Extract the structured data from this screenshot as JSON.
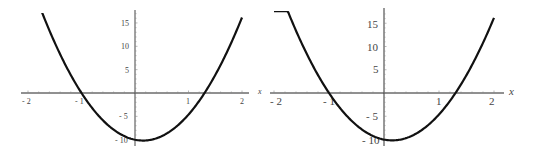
{
  "chart_data": [
    {
      "type": "line",
      "title": "",
      "xlabel": "x",
      "ylabel": "",
      "xlim": [
        -2,
        2
      ],
      "ylim": [
        -10.5,
        17.5
      ],
      "grid": false,
      "x_ticks": [
        "-2",
        "-1",
        "1",
        "2"
      ],
      "y_ticks": [
        "15",
        "10",
        "5",
        "-5",
        "-10"
      ],
      "series": [
        {
          "name": "f(x)",
          "x": [
            -2,
            -1.5,
            -1,
            -0.5,
            0,
            0.2,
            0.5,
            1,
            1.3,
            1.5,
            2
          ],
          "y": [
            25.4,
            9.6,
            0,
            -5.6,
            -10,
            -10.3,
            -9.2,
            -4.6,
            0,
            3.8,
            16.2
          ]
        }
      ]
    },
    {
      "type": "line",
      "title": "",
      "xlabel": "x",
      "ylabel": "",
      "xlim": [
        -2,
        2
      ],
      "ylim": [
        -10.5,
        17.5
      ],
      "grid": false,
      "x_ticks": [
        "-2",
        "-1",
        "1",
        "2"
      ],
      "y_ticks": [
        "15",
        "10",
        "5",
        "-5",
        "-10"
      ],
      "series": [
        {
          "name": "f(x)",
          "x": [
            -2,
            -1.5,
            -1,
            -0.5,
            0,
            0.2,
            0.5,
            1,
            1.3,
            1.5,
            2
          ],
          "y": [
            25.4,
            9.6,
            0,
            -5.6,
            -10,
            -10.3,
            -9.2,
            -4.6,
            0,
            3.8,
            16.2
          ]
        }
      ]
    }
  ],
  "plots": [
    {
      "x_axis_label": "x",
      "x_tick_labels": [
        "- 2",
        "- 1",
        "1",
        "2"
      ],
      "y_tick_labels": [
        "15",
        "10",
        "5",
        "- 5",
        "- 10"
      ]
    },
    {
      "x_axis_label": "x",
      "x_tick_labels": [
        "- 2",
        "- 1",
        "1",
        "2"
      ],
      "y_tick_labels": [
        "15",
        "10",
        "5",
        "- 5",
        "- 10"
      ]
    }
  ]
}
